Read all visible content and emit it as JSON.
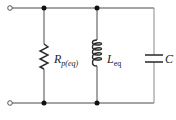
{
  "diagram": {
    "type": "parallel RLC circuit",
    "components": [
      {
        "id": "resistor",
        "symbol": "R",
        "subscript": "p(eq)",
        "label": "R_p(eq)"
      },
      {
        "id": "inductor",
        "symbol": "L",
        "subscript": "eq",
        "label": "L_eq"
      },
      {
        "id": "capacitor",
        "symbol": "C",
        "subscript": "",
        "label": "C"
      }
    ],
    "terminals": [
      "top-left terminal",
      "bottom-left terminal"
    ],
    "junctions": 4,
    "colors": {
      "wire": "#4a4a4a",
      "dot": "#111111",
      "text": "#222222"
    }
  }
}
